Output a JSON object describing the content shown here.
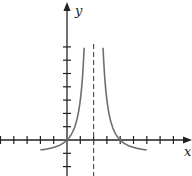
{
  "chart_data": {
    "type": "line",
    "title": "",
    "xlabel": "x",
    "ylabel": "y",
    "function": "y = 4/(x-2)^2 - 1",
    "vertical_asymptote": 2,
    "horizontal_asymptote": -1,
    "x_ticks": [
      -5,
      -4,
      -3,
      -2,
      -1,
      1,
      2,
      3,
      4,
      5,
      6,
      7,
      8
    ],
    "y_ticks": [
      -2,
      -1,
      1,
      2,
      3,
      4,
      5,
      6,
      7
    ],
    "xlim": [
      -5,
      9
    ],
    "ylim": [
      -2.7,
      10
    ],
    "grid": false,
    "legend": "none",
    "series": [
      {
        "name": "left branch",
        "x": [
          -2,
          -1,
          0,
          0.5,
          1,
          1.29
        ],
        "y": [
          -0.75,
          -0.56,
          0,
          0.78,
          3,
          7
        ]
      },
      {
        "name": "right branch",
        "x": [
          2.71,
          3,
          3.5,
          4,
          5,
          6
        ],
        "y": [
          7,
          3,
          0.78,
          0,
          -0.56,
          -0.75
        ]
      }
    ],
    "colors": {
      "axis": "#222222",
      "curve": "#6e6e6e",
      "asymptote": "#555555"
    }
  },
  "labels": {
    "x_axis": "x",
    "y_axis": "y"
  }
}
